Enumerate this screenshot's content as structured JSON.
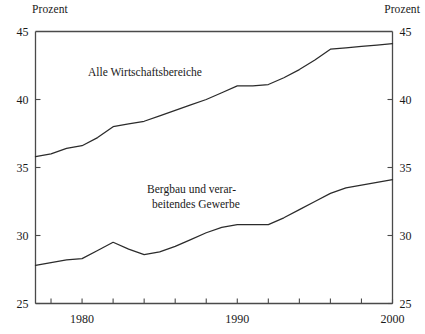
{
  "axis_unit_label_left": "Prozent",
  "axis_unit_label_right": "Prozent",
  "chart_data": {
    "type": "line",
    "title": "",
    "subtitle": "",
    "xlabel": "",
    "ylabel": "Prozent",
    "ylabel_right": "Prozent",
    "grid": false,
    "legend_position": "inline-annotation",
    "xlim": [
      1977,
      2000
    ],
    "ylim": [
      25,
      45
    ],
    "ytick_labels_left": [
      "45",
      "40",
      "35",
      "30",
      "25"
    ],
    "ytick_labels_right": [
      "45",
      "40",
      "35",
      "30",
      "25"
    ],
    "yticks": [
      45,
      40,
      35,
      30,
      25
    ],
    "xtick_labels": [
      "1980",
      "1990",
      "2000"
    ],
    "xticks_labeled": [
      1980,
      1990,
      2000
    ],
    "xticks_minor": [
      1978,
      1980,
      1982,
      1984,
      1986,
      1988,
      1990,
      1992,
      1994,
      1996,
      1998,
      2000
    ],
    "series": [
      {
        "name": "Alle Wirtschaftsbereiche",
        "label_text": "Alle Wirtschaftsbereiche",
        "x": [
          1977,
          1978,
          1979,
          1980,
          1981,
          1982,
          1983,
          1984,
          1985,
          1986,
          1987,
          1988,
          1989,
          1990,
          1991,
          1992,
          1993,
          1994,
          1995,
          1996,
          1997,
          1998,
          1999,
          2000
        ],
        "values": [
          35.8,
          36.0,
          36.4,
          36.6,
          37.2,
          38.0,
          38.2,
          38.4,
          38.8,
          39.2,
          39.6,
          40.0,
          40.5,
          41.0,
          41.0,
          41.1,
          41.6,
          42.2,
          42.9,
          43.7,
          43.8,
          43.9,
          44.0,
          44.1
        ]
      },
      {
        "name": "Bergbau und verarbeitendes Gewerbe",
        "label_text_line1": "Bergbau und verar-",
        "label_text_line2": "beitendes Gewerbe",
        "x": [
          1977,
          1978,
          1979,
          1980,
          1981,
          1982,
          1983,
          1984,
          1985,
          1986,
          1987,
          1988,
          1989,
          1990,
          1991,
          1992,
          1993,
          1994,
          1995,
          1996,
          1997,
          1998,
          1999,
          2000
        ],
        "values": [
          27.8,
          28.0,
          28.2,
          28.3,
          28.9,
          29.5,
          29.0,
          28.6,
          28.8,
          29.2,
          29.7,
          30.2,
          30.6,
          30.8,
          30.8,
          30.8,
          31.3,
          31.9,
          32.5,
          33.1,
          33.5,
          33.7,
          33.9,
          34.1
        ]
      }
    ]
  }
}
